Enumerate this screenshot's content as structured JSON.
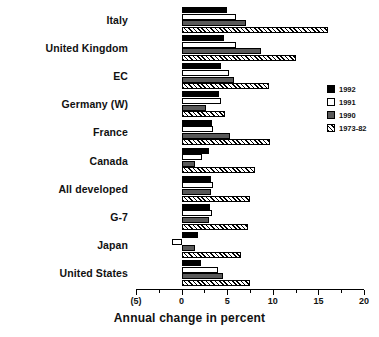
{
  "chart_data": {
    "type": "bar",
    "orientation": "horizontal",
    "title": "",
    "xlabel": "Annual change in percent",
    "ylabel": "",
    "xlim": [
      -5,
      20
    ],
    "xticks": [
      -5,
      0,
      5,
      10,
      15,
      20
    ],
    "xticklabels": [
      "(5)",
      "0",
      "5",
      "10",
      "15",
      "20"
    ],
    "grid": false,
    "legend_position": "right",
    "categories": [
      "Italy",
      "United Kingdom",
      "EC",
      "Germany (W)",
      "France",
      "Canada",
      "All developed",
      "G-7",
      "Japan",
      "United States"
    ],
    "series": [
      {
        "name": "1992",
        "color": "#000000",
        "values": [
          5.0,
          4.6,
          4.3,
          4.1,
          3.3,
          3.0,
          3.2,
          3.1,
          1.8,
          2.1
        ]
      },
      {
        "name": "1991",
        "color": "#ffffff",
        "values": [
          6.0,
          6.0,
          5.2,
          4.3,
          3.4,
          2.2,
          3.4,
          3.3,
          -1.0,
          4.0
        ]
      },
      {
        "name": "1990",
        "color": "#595959",
        "values": [
          7.1,
          8.7,
          5.8,
          2.7,
          5.3,
          1.5,
          3.2,
          3.0,
          1.5,
          4.5
        ]
      },
      {
        "name": "1973-82",
        "color": "#hatch",
        "values": [
          16.1,
          12.5,
          9.6,
          4.8,
          9.7,
          8.0,
          7.5,
          7.3,
          6.5,
          7.5
        ]
      }
    ]
  },
  "legend": {
    "entries": [
      {
        "label": "1992"
      },
      {
        "label": "1991"
      },
      {
        "label": "1990"
      },
      {
        "label": "1973-82"
      }
    ]
  }
}
